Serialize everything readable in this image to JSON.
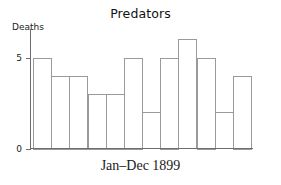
{
  "chart_data": {
    "type": "bar",
    "title": "Predators",
    "xlabel": "Jan–Dec 1899",
    "ylabel": "Deaths",
    "categories": [
      "Jan",
      "Feb",
      "Mar",
      "Apr",
      "May",
      "Jun",
      "Jul",
      "Aug",
      "Sep",
      "Oct",
      "Nov",
      "Dec"
    ],
    "values": [
      5,
      4,
      4,
      3,
      3,
      5,
      2,
      5,
      6,
      5,
      2,
      4
    ],
    "ylim": [
      0,
      6.6
    ],
    "xlim": [
      0,
      12
    ],
    "ytick_labels": [
      "0",
      "5"
    ],
    "ytick_values": [
      0,
      5
    ],
    "grid": false,
    "legend": null,
    "bar_fill_color": "#ffffff",
    "bar_stroke_color": "#9a9a9a",
    "axis_color": "#6e6e6e",
    "background_color": "#ffffff"
  },
  "axis": {
    "y_label": "Deaths",
    "x_label": "Jan–Dec 1899",
    "tick_0": "0",
    "tick_5": "5"
  },
  "header": {
    "title": "Predators"
  }
}
